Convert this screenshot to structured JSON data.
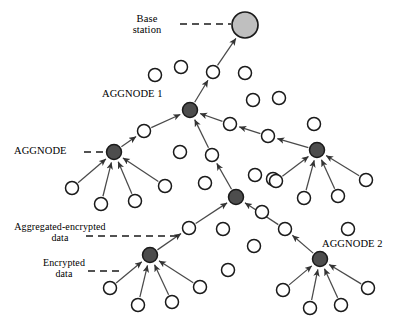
{
  "figure": {
    "type": "network-diagram",
    "title_visible": false,
    "background_color": "#ffffff",
    "width": 405,
    "height": 333
  },
  "colors": {
    "base_station_fill": "#bfbfbf",
    "aggregator_fill": "#4d4d4d",
    "sensor_fill": "#ffffff",
    "stroke": "#1a1a1a",
    "text": "#000000",
    "arrow": "#404040"
  },
  "labels": {
    "base_station": "Base\nstation",
    "aggnode_1": "AGGNODE 1",
    "aggnode": "AGGNODE",
    "aggnode_2": "AGGNODE 2",
    "aggregated_encrypted_data": "Aggregated-encrypted\ndata",
    "encrypted_data": "Encrypted\ndata"
  },
  "nodes": {
    "base_station": {
      "id": "bs",
      "kind": "base-station",
      "x": 245,
      "y": 25,
      "r": 13
    },
    "aggregators": [
      {
        "id": "agg1",
        "name": "AGGNODE 1",
        "x": 190,
        "y": 110,
        "r": 7.5
      },
      {
        "id": "aggL",
        "name": "AGGNODE",
        "x": 114,
        "y": 152,
        "r": 7.5
      },
      {
        "id": "aggR",
        "name": "",
        "x": 317,
        "y": 150,
        "r": 7.5
      },
      {
        "id": "aggM",
        "name": "",
        "x": 236,
        "y": 197,
        "r": 7.5
      },
      {
        "id": "aggBL",
        "name": "",
        "x": 150,
        "y": 255,
        "r": 7.5
      },
      {
        "id": "agg2",
        "name": "AGGNODE 2",
        "x": 320,
        "y": 259,
        "r": 7.5
      }
    ],
    "relays": [
      {
        "id": "r_bs",
        "x": 213,
        "y": 72,
        "r": 6.5
      },
      {
        "id": "r_agg1_left",
        "x": 144,
        "y": 131,
        "r": 6.5
      },
      {
        "id": "r_agg1_right1",
        "x": 230,
        "y": 124,
        "r": 6.5
      },
      {
        "id": "r_agg1_right2",
        "x": 268,
        "y": 136,
        "r": 6.5
      },
      {
        "id": "r_agg1_down",
        "x": 212,
        "y": 155,
        "r": 6.5
      },
      {
        "id": "r_aggm_left",
        "x": 189,
        "y": 228,
        "r": 6.5
      },
      {
        "id": "r_aggm_right",
        "x": 285,
        "y": 229,
        "r": 6.5
      }
    ],
    "leaves": [
      {
        "id": "L1",
        "parent": "aggL",
        "x": 72,
        "y": 188,
        "r": 6.5
      },
      {
        "id": "L2",
        "parent": "aggL",
        "x": 101,
        "y": 204,
        "r": 6.5
      },
      {
        "id": "L3",
        "parent": "aggL",
        "x": 135,
        "y": 201,
        "r": 6.5
      },
      {
        "id": "L4",
        "parent": "aggL",
        "x": 165,
        "y": 186,
        "r": 6.5
      },
      {
        "id": "R1",
        "parent": "aggR",
        "x": 276,
        "y": 181,
        "r": 6.5
      },
      {
        "id": "R2",
        "parent": "aggR",
        "x": 304,
        "y": 198,
        "r": 6.5
      },
      {
        "id": "R3",
        "parent": "aggR",
        "x": 338,
        "y": 196,
        "r": 6.5
      },
      {
        "id": "R4",
        "parent": "aggR",
        "x": 366,
        "y": 180,
        "r": 6.5
      },
      {
        "id": "B1",
        "parent": "aggBL",
        "x": 110,
        "y": 288,
        "r": 6.5
      },
      {
        "id": "B2",
        "parent": "aggBL",
        "x": 138,
        "y": 305,
        "r": 6.5
      },
      {
        "id": "B3",
        "parent": "aggBL",
        "x": 172,
        "y": 302,
        "r": 6.5
      },
      {
        "id": "B4",
        "parent": "aggBL",
        "x": 200,
        "y": 287,
        "r": 6.5
      },
      {
        "id": "C1",
        "parent": "agg2",
        "x": 283,
        "y": 290,
        "r": 6.5
      },
      {
        "id": "C2",
        "parent": "agg2",
        "x": 310,
        "y": 308,
        "r": 6.5
      },
      {
        "id": "C3",
        "parent": "agg2",
        "x": 341,
        "y": 305,
        "r": 6.5
      },
      {
        "id": "C4",
        "parent": "agg2",
        "x": 368,
        "y": 288,
        "r": 6.5
      }
    ],
    "idle": [
      {
        "id": "i1",
        "x": 155,
        "y": 75,
        "r": 6.5
      },
      {
        "id": "i2",
        "x": 181,
        "y": 67,
        "r": 6.5
      },
      {
        "id": "i3",
        "x": 245,
        "y": 73,
        "r": 6.5
      },
      {
        "id": "i4",
        "x": 253,
        "y": 100,
        "r": 6.5
      },
      {
        "id": "i5",
        "x": 279,
        "y": 98,
        "r": 6.5
      },
      {
        "id": "i6",
        "x": 314,
        "y": 124,
        "r": 6.5
      },
      {
        "id": "i7",
        "x": 180,
        "y": 152,
        "r": 6.5
      },
      {
        "id": "i8",
        "x": 255,
        "y": 175,
        "r": 6.5
      },
      {
        "id": "i9",
        "x": 273,
        "y": 179,
        "r": 6.5
      },
      {
        "id": "i10",
        "x": 205,
        "y": 183,
        "r": 6.5
      },
      {
        "id": "i11",
        "x": 223,
        "y": 229,
        "r": 6.5
      },
      {
        "id": "i12",
        "x": 254,
        "y": 246,
        "r": 6.5
      },
      {
        "id": "i13",
        "x": 228,
        "y": 270,
        "r": 6.5
      },
      {
        "id": "i14",
        "x": 348,
        "y": 229,
        "r": 6.5
      },
      {
        "id": "i15",
        "x": 262,
        "y": 212,
        "r": 6.5
      }
    ]
  },
  "edges": {
    "description": "Directed data-flow arrows; encrypted data from sensors to aggregators, aggregated-encrypted data up the tree to the base station.",
    "arrows": [
      {
        "from": "r_bs",
        "to": "bs"
      },
      {
        "from": "agg1",
        "to": "r_bs"
      },
      {
        "from": "r_agg1_left",
        "to": "agg1"
      },
      {
        "from": "aggL",
        "to": "r_agg1_left"
      },
      {
        "from": "r_agg1_right1",
        "to": "agg1"
      },
      {
        "from": "r_agg1_right2",
        "to": "r_agg1_right1"
      },
      {
        "from": "aggR",
        "to": "r_agg1_right2"
      },
      {
        "from": "r_agg1_down",
        "to": "agg1"
      },
      {
        "from": "aggM",
        "to": "r_agg1_down"
      },
      {
        "from": "r_aggm_left",
        "to": "aggM"
      },
      {
        "from": "aggBL",
        "to": "r_aggm_left"
      },
      {
        "from": "r_aggm_right",
        "to": "aggM"
      },
      {
        "from": "agg2",
        "to": "r_aggm_right"
      },
      {
        "from": "L1",
        "to": "aggL"
      },
      {
        "from": "L2",
        "to": "aggL"
      },
      {
        "from": "L3",
        "to": "aggL"
      },
      {
        "from": "L4",
        "to": "aggL"
      },
      {
        "from": "R1",
        "to": "aggR"
      },
      {
        "from": "R2",
        "to": "aggR"
      },
      {
        "from": "R3",
        "to": "aggR"
      },
      {
        "from": "R4",
        "to": "aggR"
      },
      {
        "from": "B1",
        "to": "aggBL"
      },
      {
        "from": "B2",
        "to": "aggBL"
      },
      {
        "from": "B3",
        "to": "aggBL"
      },
      {
        "from": "B4",
        "to": "aggBL"
      },
      {
        "from": "C1",
        "to": "agg2"
      },
      {
        "from": "C2",
        "to": "agg2"
      },
      {
        "from": "C3",
        "to": "agg2"
      },
      {
        "from": "C4",
        "to": "agg2"
      }
    ]
  },
  "leader_lines": [
    {
      "for": "base_station",
      "from_x": 180,
      "from_y": 24,
      "to_x": 231,
      "to_y": 24
    },
    {
      "for": "aggnode",
      "from_x": 84,
      "from_y": 152,
      "to_x": 106,
      "to_y": 152
    },
    {
      "for": "aggregated_encrypted_data",
      "from_x": 86,
      "from_y": 236,
      "to_x": 182,
      "to_y": 236
    },
    {
      "for": "encrypted_data",
      "from_x": 88,
      "from_y": 271,
      "to_x": 124,
      "to_y": 271
    }
  ]
}
